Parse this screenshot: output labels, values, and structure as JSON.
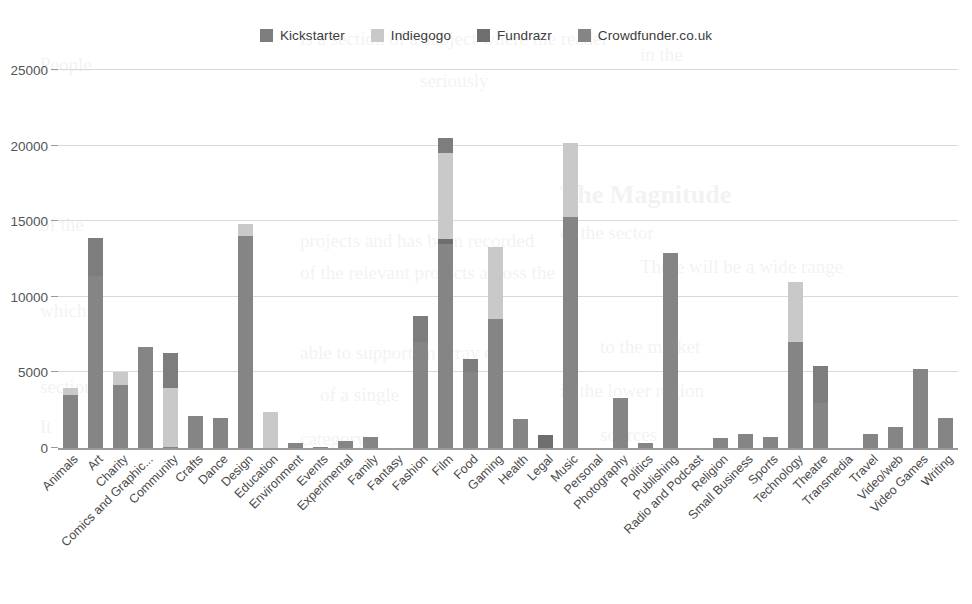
{
  "chart_data": {
    "type": "bar",
    "stacked": true,
    "title": "",
    "xlabel": "",
    "ylabel": "",
    "ylim": [
      0,
      25000
    ],
    "yticks": [
      "0",
      "5000",
      "10000",
      "15000",
      "20000",
      "25000"
    ],
    "grid": true,
    "legend_position": "top-center",
    "colors": {
      "Kickstarter": "#7d7d7d",
      "Indiegogo": "#c9c9c9",
      "Fundrazr": "#6e6e6e",
      "Crowdfunder.co.uk": "#858585"
    },
    "categories": [
      "Animals",
      "Art",
      "Charity",
      "Comics and Graphic...",
      "Community",
      "Crafts",
      "Dance",
      "Design",
      "Education",
      "Environment",
      "Events",
      "Experimental",
      "Family",
      "Fantasy",
      "Fashion",
      "Film",
      "Food",
      "Gaming",
      "Health",
      "Legal",
      "Music",
      "Personal",
      "Photography",
      "Politics",
      "Publishing",
      "Radio and Podcast",
      "Religion",
      "Small Business",
      "Sports",
      "Technology",
      "Theatre",
      "Transmedia",
      "Travel",
      "Video/web",
      "Video Games",
      "Writing"
    ],
    "series": [
      {
        "name": "Kickstarter",
        "values": [
          0,
          2500,
          0,
          0,
          2300,
          0,
          0,
          0,
          0,
          0,
          0,
          0,
          0,
          0,
          1700,
          1000,
          900,
          0,
          0,
          0,
          0,
          0,
          0,
          0,
          0,
          0,
          0,
          0,
          0,
          0,
          2400,
          0,
          0,
          0,
          0,
          0
        ]
      },
      {
        "name": "Indiegogo",
        "values": [
          500,
          0,
          800,
          0,
          3900,
          0,
          0,
          800,
          2400,
          0,
          0,
          0,
          0,
          0,
          0,
          5700,
          0,
          4800,
          0,
          0,
          4900,
          0,
          0,
          0,
          0,
          0,
          0,
          0,
          0,
          4000,
          0,
          0,
          0,
          0,
          0,
          0
        ]
      },
      {
        "name": "Fundrazr",
        "values": [
          0,
          0,
          0,
          0,
          0,
          0,
          0,
          0,
          0,
          0,
          0,
          0,
          0,
          0,
          0,
          300,
          0,
          0,
          0,
          850,
          0,
          0,
          0,
          0,
          0,
          0,
          0,
          0,
          0,
          0,
          0,
          0,
          0,
          0,
          0,
          0
        ]
      },
      {
        "name": "Crowdfunder.co.uk",
        "values": [
          3500,
          11400,
          4200,
          6700,
          100,
          2150,
          2000,
          14000,
          0,
          350,
          100,
          450,
          700,
          0,
          7000,
          13500,
          5000,
          8500,
          1900,
          0,
          15300,
          0,
          3300,
          350,
          12900,
          0,
          650,
          900,
          700,
          7000,
          3000,
          0,
          900,
          1400,
          5250,
          2000
        ]
      }
    ],
    "totals": [
      4000,
      13900,
      5000,
      7500,
      6300,
      2150,
      2000,
      14800,
      2400,
      350,
      100,
      450,
      700,
      0,
      8700,
      20500,
      5900,
      13300,
      1900,
      850,
      20200,
      0,
      3300,
      350,
      12900,
      0,
      650,
      900,
      700,
      11000,
      5400,
      0,
      900,
      1400,
      5250,
      2000
    ]
  },
  "legend": {
    "items": [
      {
        "label": "Kickstarter",
        "color": "#7d7d7d"
      },
      {
        "label": "Indiegogo",
        "color": "#c9c9c9"
      },
      {
        "label": "Fundrazr",
        "color": "#6e6e6e"
      },
      {
        "label": "Crowdfunder.co.uk",
        "color": "#858585"
      }
    ]
  }
}
